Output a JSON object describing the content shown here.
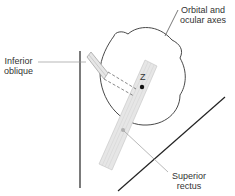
{
  "diagram": {
    "labels": {
      "orbital_axes": "Orbital and\nocular axes",
      "inferior_oblique": "Inferior\noblique",
      "superior_rectus": "Superior\nrectus",
      "center_point": "Z"
    },
    "colors": {
      "line": "#222222",
      "muscle_fill": "#e4e4e4",
      "muscle_stroke": "#b5b5b5",
      "leader": "#999999",
      "text": "#333333"
    }
  }
}
